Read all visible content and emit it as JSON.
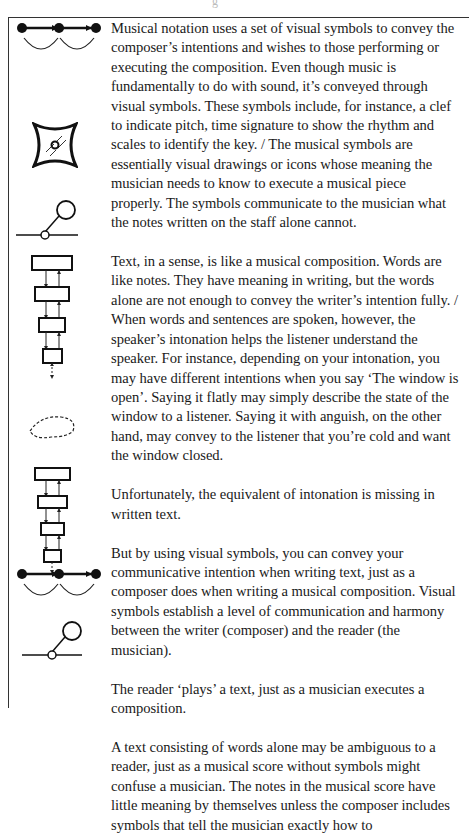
{
  "document": {
    "top_fragment": "g",
    "paragraphs": [
      {
        "id": "musical-notation",
        "text": "Musical notation uses a set of visual symbols to convey the composer’s intentions and wishes to those performing or executing the composition. Even though music is fundamentally to do with sound, it’s conveyed through visual symbols. These symbols include, for instance, a clef to indicate pitch, time signature to show the rhythm and scales to identify the key. / The musical symbols are essentially visual drawings or icons whose meaning the musician needs to know to execute a musical piece properly. The symbols communicate to the musician what the notes written on the staff alone cannot."
      },
      {
        "id": "text-as-composition",
        "text": "Text, in a sense, is like a musical composition. Words are like notes. They have meaning in writing, but the words alone are not enough to convey the writer’s intention fully. / When words and sentences are spoken, however, the speaker’s intonation helps the listener understand the speaker. For instance, depending on your intonation, you may have different intentions when you say ‘The window is open’. Saying it flatly may simply describe the state of the window to a listener. Saying it with anguish, on the other hand, may convey to the listener that you’re cold and want the window closed."
      },
      {
        "id": "intonation-missing",
        "text": "Unfortunately, the equivalent of intonation is missing in written text."
      },
      {
        "id": "visual-symbols",
        "text": "But by using visual symbols, you can convey your communicative intention when writing text, just as a composer does when writing a musical composition. Visual symbols establish a level of communication and harmony between the writer (composer) and the reader (the musician)."
      },
      {
        "id": "reader-plays",
        "text": "The reader ‘plays’ a text, just as a musician executes a composition."
      },
      {
        "id": "ambiguous-text",
        "text": "A text consisting of words alone may be ambiguous to a reader, just as a musical score without symbols might confuse a musician. The notes in the musical score have little meaning by themselves unless the composer includes symbols that tell the musician exactly how to"
      }
    ],
    "margin_icons": [
      "linked-nodes-icon",
      "concave-square-icon",
      "lollipop-node-icon",
      "stacked-boxes-icon",
      "dashed-blob-icon",
      "stacked-boxes-icon",
      "linked-nodes-icon",
      "lollipop-node-icon"
    ],
    "colors": {
      "ink": "#1a1a1a",
      "frame": "#333333",
      "background": "#ffffff"
    }
  }
}
